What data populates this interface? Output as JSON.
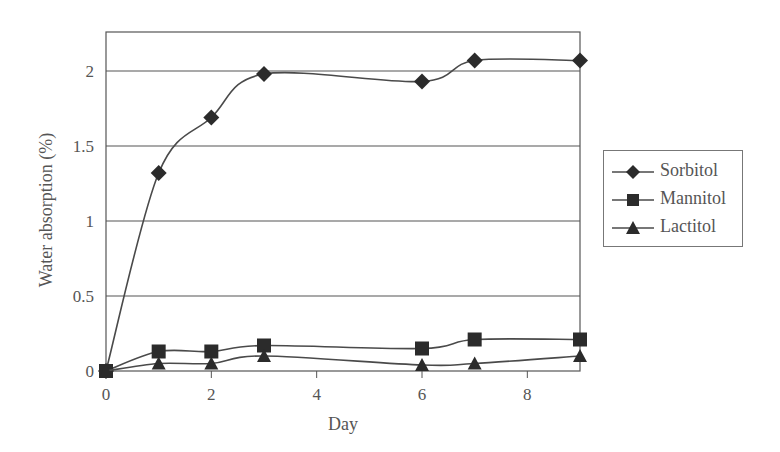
{
  "chart_data": {
    "type": "line",
    "title": "",
    "xlabel": "Day",
    "ylabel": "Water absorption (%)",
    "xlim": [
      0,
      9
    ],
    "ylim": [
      0,
      2.25
    ],
    "x_ticks": [
      0,
      2,
      4,
      6,
      8
    ],
    "y_ticks": [
      0,
      0.5,
      1,
      1.5,
      2
    ],
    "x_tick_labels": [
      "0",
      "2",
      "4",
      "6",
      "8"
    ],
    "y_tick_labels": [
      "0",
      "0.5",
      "1",
      "1.5",
      "2"
    ],
    "grid": "horizontal",
    "legend_position": "right",
    "x": [
      0,
      1,
      2,
      3,
      6,
      7,
      9
    ],
    "series": [
      {
        "name": "Sorbitol",
        "marker": "diamond",
        "values": [
          0,
          1.32,
          1.69,
          1.98,
          1.93,
          2.07,
          2.07
        ]
      },
      {
        "name": "Mannitol",
        "marker": "square",
        "values": [
          0,
          0.13,
          0.13,
          0.17,
          0.15,
          0.21,
          0.21
        ]
      },
      {
        "name": "Lactitol",
        "marker": "triangle",
        "values": [
          0,
          0.05,
          0.05,
          0.1,
          0.04,
          0.05,
          0.1
        ]
      }
    ]
  },
  "colors": {
    "line": "#4a4a4a",
    "marker": "#2b2b2b",
    "grid": "#555555",
    "text": "#555555"
  },
  "legend": {
    "items": [
      {
        "label": "Sorbitol",
        "marker": "diamond-icon"
      },
      {
        "label": "Mannitol",
        "marker": "square-icon"
      },
      {
        "label": "Lactitol",
        "marker": "triangle-icon"
      }
    ]
  }
}
